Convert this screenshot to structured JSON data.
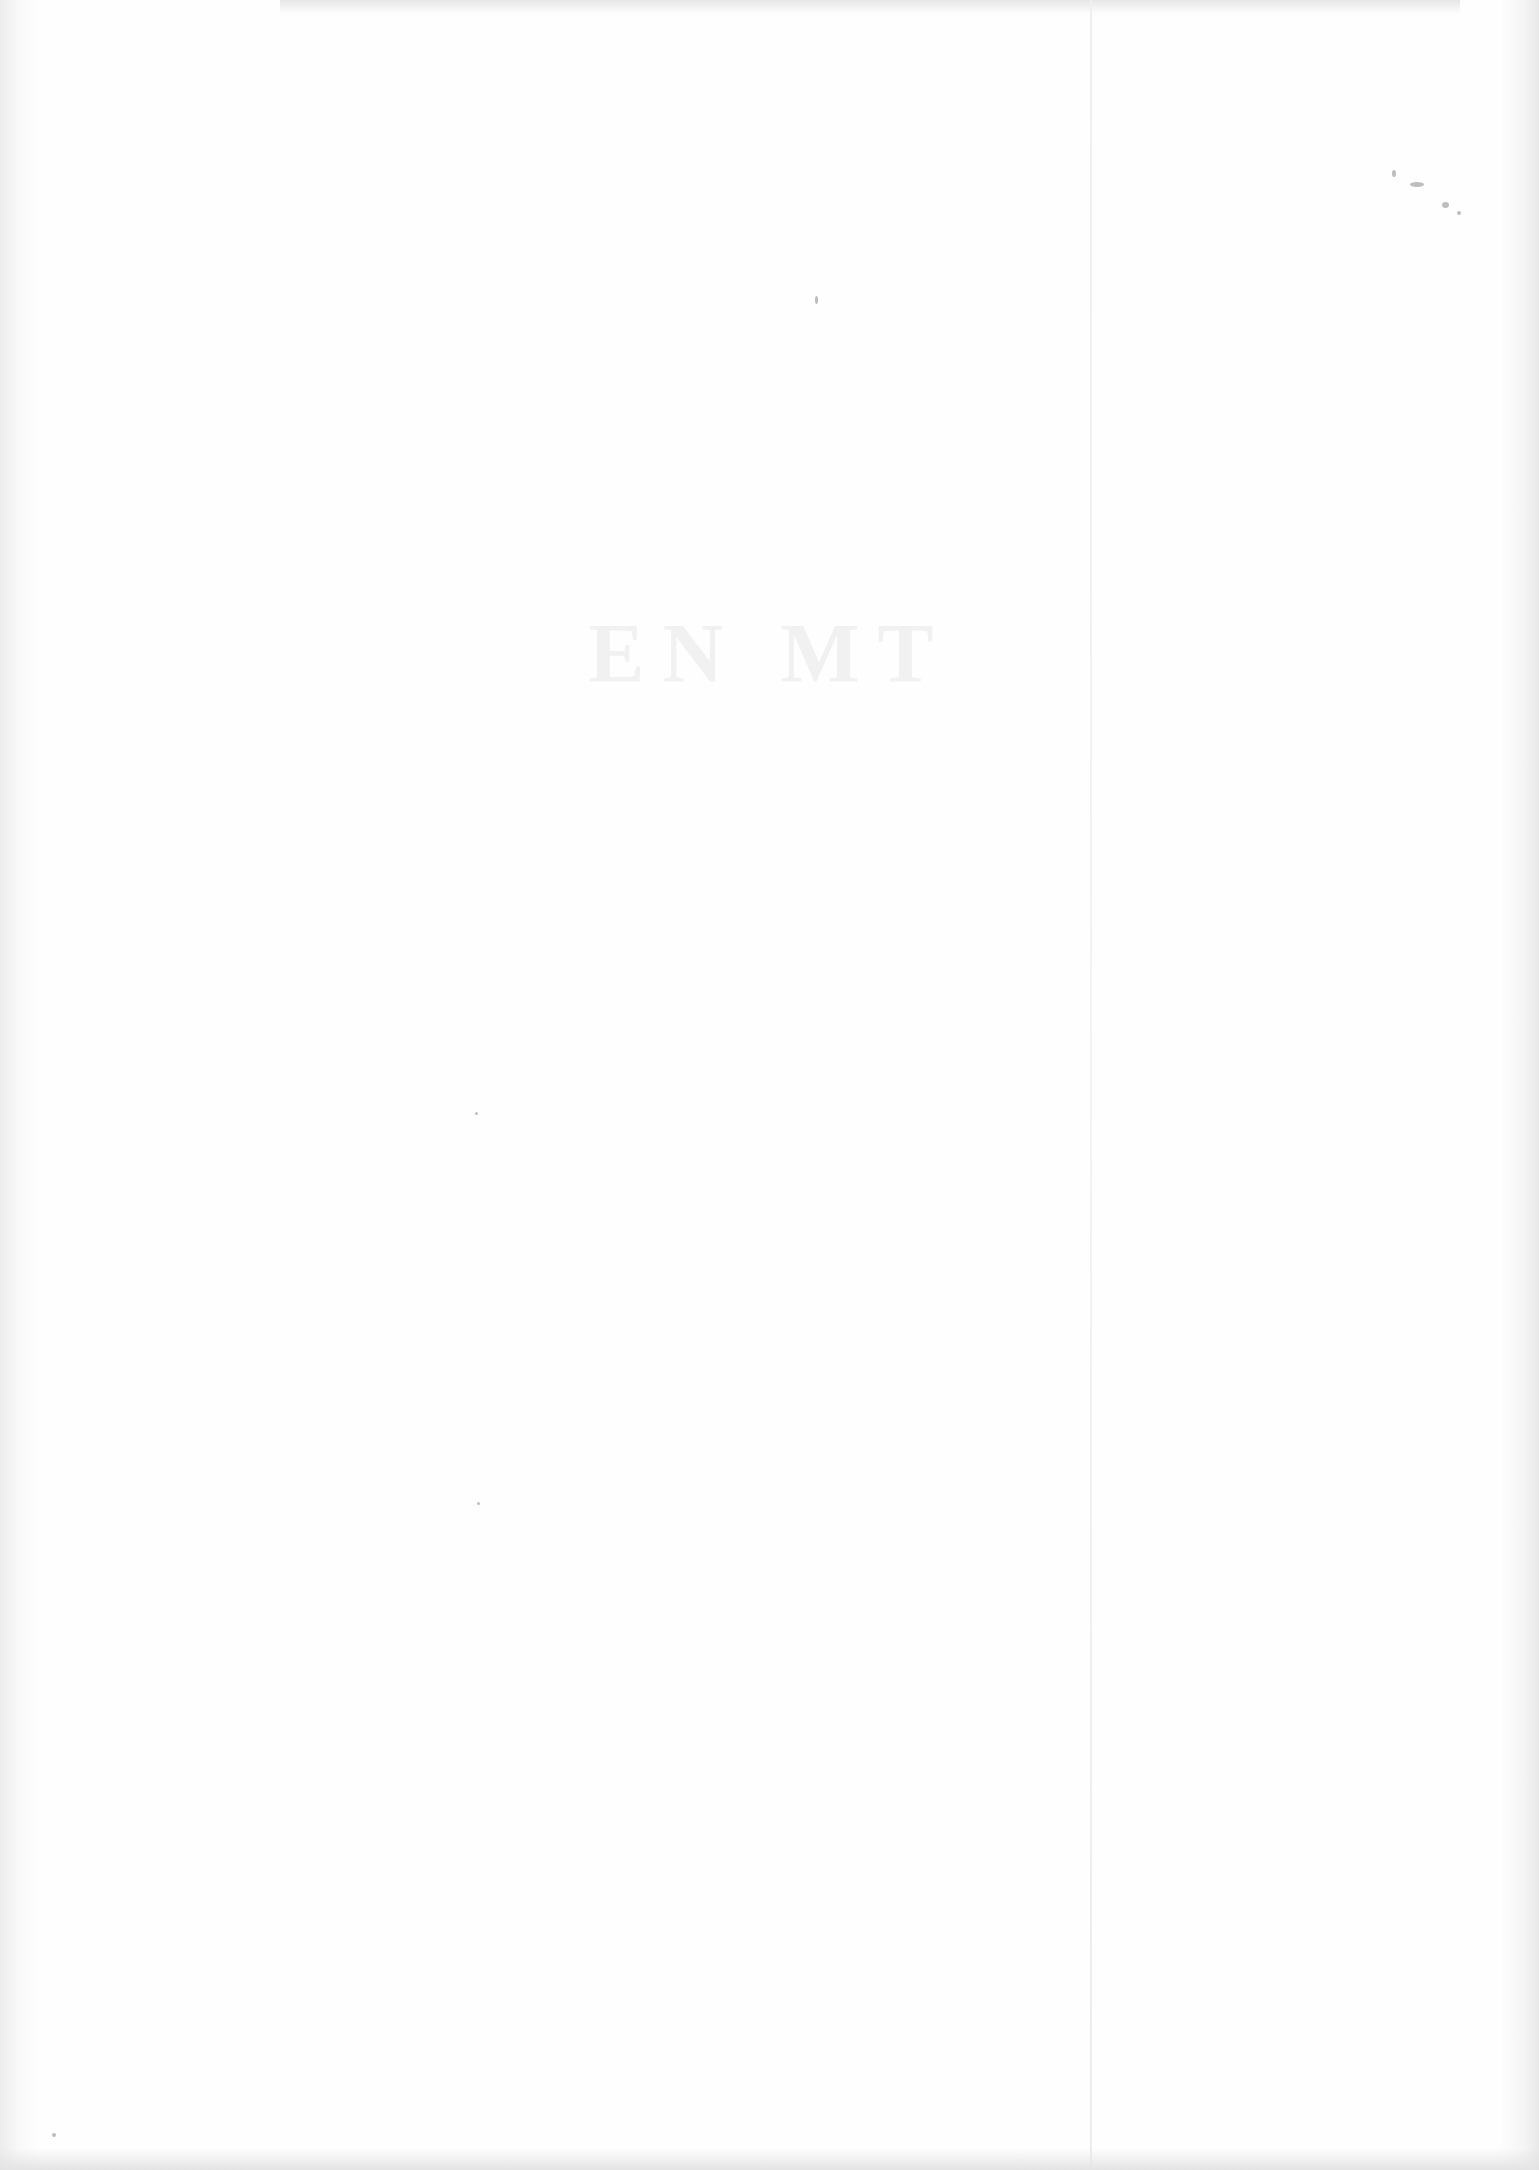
{
  "page": {
    "type": "blank-scanned-page",
    "bleed_through_text": "EN          MT",
    "colors": {
      "paper": "#fdfdfd",
      "edge_shadow": "#e6e6e6",
      "fold_line": "#efefef",
      "specks": "#bdbdbd"
    }
  }
}
